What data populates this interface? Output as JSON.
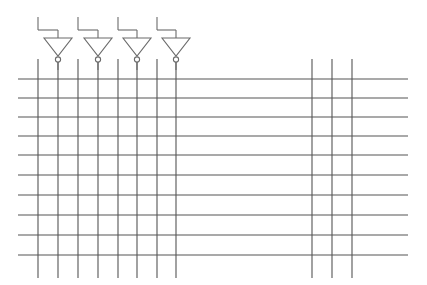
{
  "canvas": {
    "width": 427,
    "height": 285,
    "background_color": "#ffffff",
    "title": "Inverter row over bus grid schematic"
  },
  "style": {
    "line_color": "#6b6b6b",
    "line_color_dark": "#555555",
    "line_width": 1.1,
    "bubble_radius": 2.6,
    "bubble_fill": "#ffffff"
  },
  "grid": {
    "horizontal_lines": {
      "count": 10,
      "x_start": 18,
      "x_end": 408,
      "y_values": [
        79,
        98,
        117,
        136,
        155,
        175,
        195,
        215,
        235,
        255
      ]
    },
    "vertical_lines_left": {
      "count": 8,
      "label": "inverter output / signal columns",
      "y_start": 59,
      "y_end": 278,
      "x_values": [
        38,
        58,
        78,
        98,
        118,
        137,
        157,
        176
      ]
    },
    "vertical_lines_right": {
      "count": 3,
      "label": "right bus columns",
      "y_start": 59,
      "y_end": 278,
      "x_values": [
        312,
        332,
        352
      ]
    }
  },
  "inverters": {
    "count": 4,
    "label": "inverter (NOT gate) cells",
    "geometry": {
      "input_stub_y_top": 17,
      "branch_y": 30,
      "triangle_top_y": 38,
      "triangle_apex_y": 56,
      "triangle_half_width": 14,
      "bubble_cy": 59.5,
      "output_y_end": 70
    },
    "items": [
      {
        "name": "inverter-1",
        "input_x": 38,
        "center_x": 58,
        "tri_left": 44,
        "tri_right": 72
      },
      {
        "name": "inverter-2",
        "input_x": 78,
        "center_x": 98,
        "tri_left": 84,
        "tri_right": 112
      },
      {
        "name": "inverter-3",
        "input_x": 118,
        "center_x": 137,
        "tri_left": 123,
        "tri_right": 151
      },
      {
        "name": "inverter-4",
        "input_x": 157,
        "center_x": 176,
        "tri_left": 162,
        "tri_right": 190
      }
    ]
  }
}
